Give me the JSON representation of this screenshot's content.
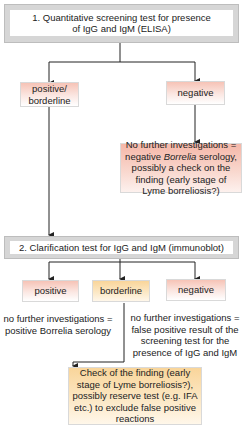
{
  "diagram": {
    "step1": {
      "label": "1. Quantitative screening test for presence of IgG and IgM (ELISA)"
    },
    "step1_results": {
      "positive_borderline": "positive/ borderline",
      "negative": "negative"
    },
    "negative_outcome": {
      "part1": "No further investigations = negative ",
      "italic": "Borrelia",
      "part2": " serology, possibly a check on the finding (early stage of Lyme borreliosis?)"
    },
    "step2": {
      "label": "2. Clarification test for IgG and IgM (immunoblot)"
    },
    "step2_results": {
      "positive": "positive",
      "borderline": "borderline",
      "negative": "negative"
    },
    "positive_outcome": "no further investigations = positive Borrelia serology",
    "negative2_outcome": "no further investigations = false positive result of the screening test for the presence of IgG and IgM",
    "borderline_outcome": "Check of the finding (early stage of Lyme borreliosis?), possibly reserve test (e.g. IFA etc.) to exclude false positive reactions",
    "colors": {
      "frame_gray": "#d6d6d6",
      "positive_red": "#f6c3b6",
      "borderline_yellow": "#f9d59a",
      "line": "#222222"
    }
  }
}
